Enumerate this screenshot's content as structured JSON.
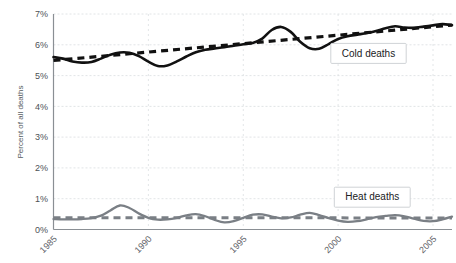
{
  "chart_data": {
    "type": "line",
    "title": "",
    "xlabel": "",
    "ylabel": "Percent of all deaths",
    "xlim": [
      1985,
      2006
    ],
    "ylim": [
      0,
      7
    ],
    "grid": true,
    "legend_position": "inline-right",
    "y_tick_labels": [
      "7%",
      "6%",
      "5%",
      "4%",
      "3%",
      "2%",
      "1%",
      "0%"
    ],
    "y_tick_values": [
      7,
      6,
      5,
      4,
      3,
      2,
      1,
      0
    ],
    "x_tick_labels": [
      "1985",
      "1990",
      "1995",
      "2000",
      "2005"
    ],
    "x_tick_values": [
      1985,
      1990,
      1995,
      2000,
      2005
    ],
    "x": [
      1985,
      1985.5,
      1986,
      1986.5,
      1987,
      1987.5,
      1988,
      1988.5,
      1989,
      1989.5,
      1990,
      1990.5,
      1991,
      1991.5,
      1992,
      1992.5,
      1993,
      1993.5,
      1994,
      1994.5,
      1995,
      1995.5,
      1996,
      1996.5,
      1997,
      1997.5,
      1998,
      1998.5,
      1999,
      1999.5,
      2000,
      2000.5,
      2001,
      2001.5,
      2002,
      2002.5,
      2003,
      2003.5,
      2004,
      2004.5,
      2005,
      2005.5,
      2006
    ],
    "series": [
      {
        "name": "Cold deaths",
        "color": "#111111",
        "style": "solid",
        "values": [
          5.6,
          5.55,
          5.46,
          5.42,
          5.44,
          5.55,
          5.68,
          5.75,
          5.74,
          5.63,
          5.45,
          5.31,
          5.33,
          5.46,
          5.62,
          5.76,
          5.84,
          5.88,
          5.92,
          5.97,
          6.02,
          6.06,
          6.2,
          6.48,
          6.58,
          6.42,
          6.1,
          5.89,
          5.87,
          6.02,
          6.19,
          6.28,
          6.33,
          6.38,
          6.45,
          6.54,
          6.6,
          6.56,
          6.55,
          6.59,
          6.63,
          6.67,
          6.64
        ]
      },
      {
        "name": "Heat deaths",
        "color": "#7a7f85",
        "style": "solid",
        "values": [
          0.34,
          0.33,
          0.33,
          0.34,
          0.37,
          0.45,
          0.62,
          0.78,
          0.7,
          0.52,
          0.38,
          0.32,
          0.33,
          0.38,
          0.46,
          0.5,
          0.43,
          0.31,
          0.23,
          0.27,
          0.38,
          0.48,
          0.49,
          0.42,
          0.36,
          0.39,
          0.48,
          0.54,
          0.47,
          0.37,
          0.29,
          0.25,
          0.27,
          0.33,
          0.4,
          0.44,
          0.47,
          0.43,
          0.35,
          0.28,
          0.27,
          0.33,
          0.42
        ]
      }
    ],
    "trendlines": [
      {
        "name": "Cold deaths trend",
        "color": "#111111",
        "style": "dashed",
        "x": [
          1985,
          2006
        ],
        "values": [
          5.49,
          6.64
        ]
      },
      {
        "name": "Heat deaths trend",
        "color": "#7a7f85",
        "style": "dashed",
        "x": [
          1985,
          2006
        ],
        "values": [
          0.385,
          0.375
        ]
      }
    ],
    "annotations": [
      {
        "text": "Cold deaths",
        "x": 2001.6,
        "y": 5.72
      },
      {
        "text": "Heat deaths",
        "x": 2001.8,
        "y": 1.05
      }
    ]
  },
  "legend": {
    "cold_label": "Cold deaths",
    "heat_label": "Heat deaths"
  },
  "axes": {
    "y_axis_title": "Percent of all deaths"
  }
}
